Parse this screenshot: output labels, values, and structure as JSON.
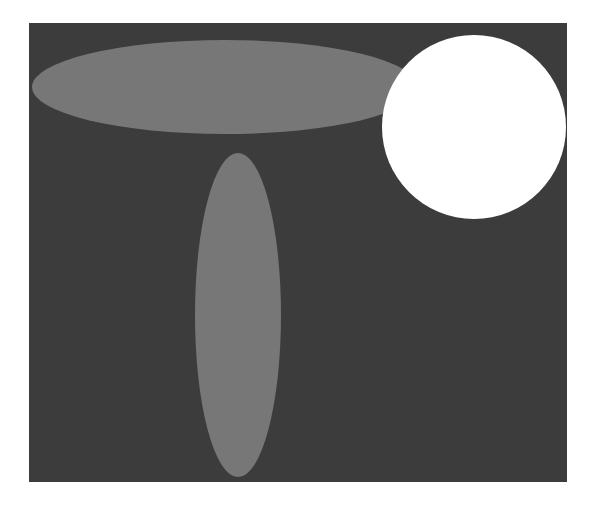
{
  "figure": {
    "background": {
      "color": "#3c3c3c",
      "x": 29,
      "y": 23,
      "width": 538,
      "height": 459
    },
    "shapes": [
      {
        "name": "horizontal-ellipse",
        "type": "ellipse",
        "cx": 225,
        "cy": 87,
        "rx": 193,
        "ry": 47,
        "color": "#777777"
      },
      {
        "name": "vertical-ellipse",
        "type": "ellipse",
        "cx": 238,
        "cy": 315,
        "rx": 43,
        "ry": 162,
        "color": "#777777"
      },
      {
        "name": "circle",
        "type": "circle",
        "cx": 474,
        "cy": 127,
        "r": 92,
        "color": "#ffffff"
      }
    ]
  }
}
